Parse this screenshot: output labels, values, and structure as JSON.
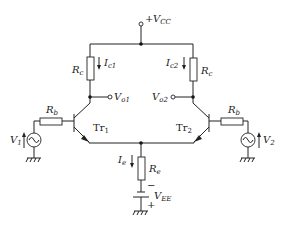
{
  "supply": {
    "vcc": {
      "sign": "+",
      "main": "V",
      "sub": "CC"
    },
    "vee": {
      "main": "V",
      "sub": "EE",
      "minus": "−",
      "plus": "+"
    }
  },
  "left": {
    "rc": {
      "main": "R",
      "sub": "c"
    },
    "ic": {
      "main": "I",
      "sub": "c1"
    },
    "vo": {
      "main": "V",
      "sub": "o1"
    },
    "rb": {
      "main": "R",
      "sub": "b"
    },
    "tr": {
      "main": "Tr",
      "sub": "1"
    },
    "vin": {
      "main": "V",
      "sub": "1"
    }
  },
  "right": {
    "rc": {
      "main": "R",
      "sub": "c"
    },
    "ic": {
      "main": "I",
      "sub": "c2"
    },
    "vo": {
      "main": "V",
      "sub": "o2"
    },
    "rb": {
      "main": "R",
      "sub": "b"
    },
    "tr": {
      "main": "Tr",
      "sub": "2"
    },
    "vin": {
      "main": "V",
      "sub": "2"
    }
  },
  "tail": {
    "re": {
      "main": "R",
      "sub": "e"
    },
    "ie": {
      "main": "I",
      "sub": "e"
    }
  }
}
